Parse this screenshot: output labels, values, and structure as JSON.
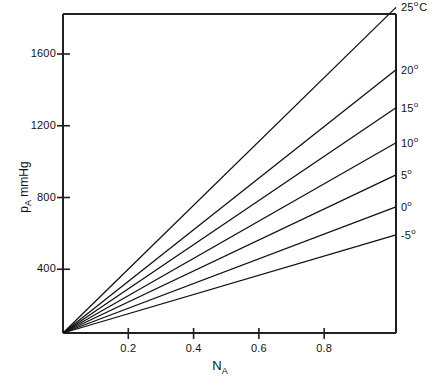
{
  "chart_data": {
    "type": "line",
    "title": "",
    "xlabel": "N_A",
    "xlabel_main": "N",
    "xlabel_sub": "A",
    "ylabel": "p_A mmHg",
    "ylabel_main": "p",
    "ylabel_sub": "A",
    "ylabel_unit": " mmHg",
    "xlim": [
      0,
      1.02
    ],
    "ylim": [
      0,
      1860
    ],
    "grid": false,
    "legend_position": "right-of-axes",
    "xticks": [
      0.2,
      0.4,
      0.6,
      0.8
    ],
    "xtick_labels": [
      "0.2",
      "0.4",
      "0.6",
      "0.8"
    ],
    "yticks": [
      400,
      800,
      1200,
      1600
    ],
    "ytick_labels": [
      "400",
      "800",
      "1200",
      "1600"
    ],
    "series": [
      {
        "name": "25° C",
        "label_main": "25",
        "label_deg": "o",
        "label_unit": "C",
        "temperature_c": 25,
        "x": [
          0,
          1.02
        ],
        "values": [
          0,
          1860
        ],
        "endpoint_value": 1860
      },
      {
        "name": "20°",
        "label_main": "20",
        "label_deg": "o",
        "label_unit": "",
        "temperature_c": 20,
        "x": [
          0,
          1.02
        ],
        "values": [
          0,
          1512
        ],
        "endpoint_value": 1512
      },
      {
        "name": "15°",
        "label_main": "15",
        "label_deg": "o",
        "label_unit": "",
        "temperature_c": 15,
        "x": [
          0,
          1.02
        ],
        "values": [
          0,
          1300
        ],
        "endpoint_value": 1300
      },
      {
        "name": "10°",
        "label_main": "10",
        "label_deg": "o",
        "label_unit": "",
        "temperature_c": 10,
        "x": [
          0,
          1.02
        ],
        "values": [
          0,
          1105
        ],
        "endpoint_value": 1105
      },
      {
        "name": "5°",
        "label_main": "5",
        "label_deg": "o",
        "label_unit": "",
        "temperature_c": 5,
        "x": [
          0,
          1.02
        ],
        "values": [
          0,
          926
        ],
        "endpoint_value": 926
      },
      {
        "name": "0°",
        "label_main": "0",
        "label_deg": "o",
        "label_unit": "",
        "temperature_c": 0,
        "x": [
          0,
          1.02
        ],
        "values": [
          0,
          748
        ],
        "endpoint_value": 748
      },
      {
        "name": "-5°",
        "label_main": "-5",
        "label_deg": "o",
        "label_unit": "",
        "temperature_c": -5,
        "x": [
          0,
          1.02
        ],
        "values": [
          0,
          592
        ],
        "endpoint_value": 592
      }
    ],
    "colors": {
      "line": "#101010",
      "axis": "#202020",
      "text": "#111111",
      "background": "#ffffff"
    }
  }
}
